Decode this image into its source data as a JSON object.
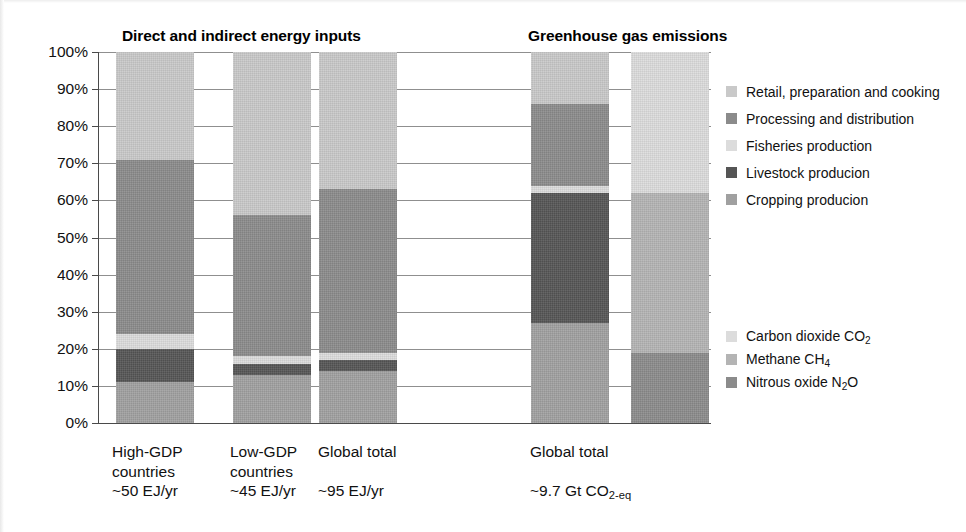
{
  "titles": {
    "energy": "Direct and indirect energy inputs",
    "ghg": "Greenhouse gas emissions"
  },
  "axis": {
    "y_ticks": [
      "100%",
      "90%",
      "80%",
      "70%",
      "60%",
      "50%",
      "40%",
      "30%",
      "20%",
      "10%",
      "0%"
    ]
  },
  "legends": {
    "stage": {
      "items": [
        {
          "label": "Retail, preparation and cooking",
          "color": "#c9c9c9"
        },
        {
          "label": "Processing and distribution",
          "color": "#8b8b8b"
        },
        {
          "label": "Fisheries production",
          "color": "#dcdcdc"
        },
        {
          "label": "Livestock producion",
          "color": "#555555"
        },
        {
          "label": "Cropping producion",
          "color": "#a0a0a0"
        }
      ]
    },
    "gas": {
      "items": [
        {
          "label": "Carbon dioxide CO",
          "sub": "2",
          "color": "#dcdcdc"
        },
        {
          "label": "Methane CH",
          "sub": "4",
          "color": "#b4b4b4"
        },
        {
          "label": "Nitrous oxide N",
          "sub": "2",
          "label2": "O",
          "color": "#8b8b8b"
        }
      ]
    }
  },
  "x_labels": [
    {
      "l1": "High-GDP",
      "l2": "countries",
      "l3": "~50 EJ/yr"
    },
    {
      "l1": "Low-GDP",
      "l2": "countries",
      "l3": "~45 EJ/yr"
    },
    {
      "l1": "Global total",
      "l2": "",
      "l3": "~95 EJ/yr"
    },
    {
      "l1": "Global total",
      "l2": "",
      "l3": "~9.7  Gt  CO",
      "sub": "2-eq"
    }
  ],
  "chart_data": {
    "type": "bar",
    "subtitle": "100% stacked bars of food-system shares",
    "xlabel": "",
    "ylabel": "Share of total (%)",
    "ylim": [
      0,
      100
    ],
    "grid": true,
    "stacked": true,
    "normalized_percent": true,
    "legend_position": "right",
    "panels": [
      {
        "name": "Direct and indirect energy inputs",
        "unit": "EJ/yr",
        "categories": [
          "High-GDP countries ~50 EJ/yr",
          "Low-GDP countries ~45 EJ/yr",
          "Global total ~95 EJ/yr"
        ],
        "totals": [
          50,
          45,
          95
        ],
        "series": [
          {
            "name": "Cropping producion",
            "color": "#a0a0a0",
            "values": [
              11,
              13,
              14
            ]
          },
          {
            "name": "Livestock producion",
            "color": "#555555",
            "values": [
              9,
              3,
              3
            ]
          },
          {
            "name": "Fisheries production",
            "color": "#dcdcdc",
            "values": [
              4,
              2,
              2
            ]
          },
          {
            "name": "Processing and distribution",
            "color": "#8b8b8b",
            "values": [
              47,
              38,
              44
            ]
          },
          {
            "name": "Retail, preparation and cooking",
            "color": "#c9c9c9",
            "values": [
              29,
              44,
              37
            ]
          }
        ]
      },
      {
        "name": "Greenhouse gas emissions by stage",
        "unit": "Gt CO2-eq",
        "categories": [
          "Global total ~9.7 Gt CO2-eq"
        ],
        "totals": [
          9.7
        ],
        "series": [
          {
            "name": "Cropping producion",
            "color": "#a0a0a0",
            "values": [
              27
            ]
          },
          {
            "name": "Livestock producion",
            "color": "#555555",
            "values": [
              35
            ]
          },
          {
            "name": "Fisheries production",
            "color": "#dcdcdc",
            "values": [
              2
            ]
          },
          {
            "name": "Processing and distribution",
            "color": "#8b8b8b",
            "values": [
              22
            ]
          },
          {
            "name": "Retail, preparation and cooking",
            "color": "#c9c9c9",
            "values": [
              14
            ]
          }
        ]
      },
      {
        "name": "Greenhouse gas emissions by gas",
        "unit": "Gt CO2-eq",
        "categories": [
          "Global total ~9.7 Gt CO2-eq"
        ],
        "totals": [
          9.7
        ],
        "series": [
          {
            "name": "Nitrous oxide N2O",
            "color": "#8b8b8b",
            "values": [
              19
            ]
          },
          {
            "name": "Methane CH4",
            "color": "#b4b4b4",
            "values": [
              43
            ]
          },
          {
            "name": "Carbon dioxide CO2",
            "color": "#dcdcdc",
            "values": [
              38
            ]
          }
        ]
      }
    ]
  },
  "bars": [
    {
      "id": "bar-high-gdp",
      "x": 17,
      "segments": [
        {
          "name": "cropping",
          "from": 0,
          "to": 11,
          "color": "#a0a0a0"
        },
        {
          "name": "livestock",
          "from": 11,
          "to": 20,
          "color": "#555555"
        },
        {
          "name": "fisheries",
          "from": 20,
          "to": 24,
          "color": "#dcdcdc"
        },
        {
          "name": "processing",
          "from": 24,
          "to": 71,
          "color": "#8b8b8b"
        },
        {
          "name": "retail",
          "from": 71,
          "to": 100,
          "color": "#c9c9c9"
        }
      ]
    },
    {
      "id": "bar-low-gdp",
      "x": 134,
      "segments": [
        {
          "name": "cropping",
          "from": 0,
          "to": 13,
          "color": "#a0a0a0"
        },
        {
          "name": "livestock",
          "from": 13,
          "to": 16,
          "color": "#555555"
        },
        {
          "name": "fisheries",
          "from": 16,
          "to": 18,
          "color": "#dcdcdc"
        },
        {
          "name": "processing",
          "from": 18,
          "to": 56,
          "color": "#8b8b8b"
        },
        {
          "name": "retail",
          "from": 56,
          "to": 100,
          "color": "#c9c9c9"
        }
      ]
    },
    {
      "id": "bar-global-energy",
      "x": 220,
      "segments": [
        {
          "name": "cropping",
          "from": 0,
          "to": 14,
          "color": "#a0a0a0"
        },
        {
          "name": "livestock",
          "from": 14,
          "to": 17,
          "color": "#555555"
        },
        {
          "name": "fisheries",
          "from": 17,
          "to": 19,
          "color": "#dcdcdc"
        },
        {
          "name": "processing",
          "from": 19,
          "to": 63,
          "color": "#8b8b8b"
        },
        {
          "name": "retail",
          "from": 63,
          "to": 100,
          "color": "#c9c9c9"
        }
      ]
    },
    {
      "id": "bar-ghg-stage",
      "x": 432,
      "segments": [
        {
          "name": "cropping",
          "from": 0,
          "to": 27,
          "color": "#a0a0a0"
        },
        {
          "name": "livestock",
          "from": 27,
          "to": 62,
          "color": "#555555"
        },
        {
          "name": "fisheries",
          "from": 62,
          "to": 64,
          "color": "#dcdcdc"
        },
        {
          "name": "processing",
          "from": 64,
          "to": 86,
          "color": "#8b8b8b"
        },
        {
          "name": "retail",
          "from": 86,
          "to": 100,
          "color": "#c9c9c9"
        }
      ]
    },
    {
      "id": "bar-ghg-gas",
      "x": 532,
      "segments": [
        {
          "name": "n2o",
          "from": 0,
          "to": 19,
          "color": "#8b8b8b"
        },
        {
          "name": "ch4",
          "from": 19,
          "to": 62,
          "color": "#b4b4b4"
        },
        {
          "name": "co2",
          "from": 62,
          "to": 100,
          "color": "#dcdcdc"
        }
      ]
    }
  ]
}
